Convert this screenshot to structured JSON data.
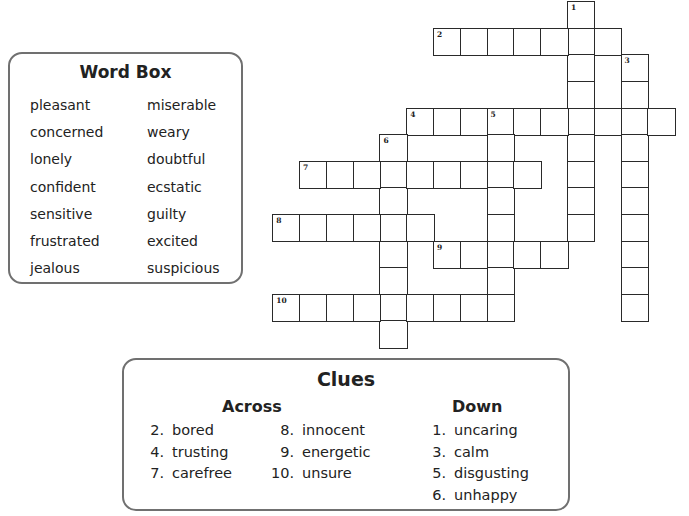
{
  "word_box": {
    "title": "Word Box",
    "left_column": [
      "pleasant",
      "concerned",
      "lonely",
      "confident",
      "sensitive",
      "frustrated",
      "jealous"
    ],
    "right_column": [
      "miserable",
      "weary",
      "doubtful",
      "ecstatic",
      "guilty",
      "excited",
      "suspicious"
    ]
  },
  "clues": {
    "title": "Clues",
    "across_heading": "Across",
    "down_heading": "Down",
    "across": [
      {
        "num": "2.",
        "text": "bored"
      },
      {
        "num": "4.",
        "text": "trusting"
      },
      {
        "num": "7.",
        "text": "carefree"
      },
      {
        "num": "8.",
        "text": "innocent"
      },
      {
        "num": "9.",
        "text": "energetic"
      },
      {
        "num": "10.",
        "text": "unsure"
      }
    ],
    "down": [
      {
        "num": "1.",
        "text": "uncaring"
      },
      {
        "num": "3.",
        "text": "calm"
      },
      {
        "num": "5.",
        "text": "disgusting"
      },
      {
        "num": "6.",
        "text": "unhappy"
      }
    ]
  },
  "grid": {
    "origin_x": 273,
    "origin_y": 2,
    "cell_w": 26.8,
    "cell_h": 26.6,
    "entries": [
      {
        "num": "1",
        "dir": "down",
        "row": 0,
        "col": 11,
        "len": 9
      },
      {
        "num": "2",
        "dir": "across",
        "row": 1,
        "col": 6,
        "len": 7
      },
      {
        "num": "3",
        "dir": "down",
        "row": 2,
        "col": 13,
        "len": 10
      },
      {
        "num": "4",
        "dir": "across",
        "row": 4,
        "col": 5,
        "len": 10
      },
      {
        "num": "5",
        "dir": "down",
        "row": 4,
        "col": 8,
        "len": 8
      },
      {
        "num": "6",
        "dir": "down",
        "row": 5,
        "col": 4,
        "len": 8
      },
      {
        "num": "7",
        "dir": "across",
        "row": 6,
        "col": 1,
        "len": 9
      },
      {
        "num": "8",
        "dir": "across",
        "row": 8,
        "col": 0,
        "len": 6
      },
      {
        "num": "9",
        "dir": "across",
        "row": 9,
        "col": 6,
        "len": 5
      },
      {
        "num": "10",
        "dir": "across",
        "row": 11,
        "col": 0,
        "len": 9
      }
    ]
  }
}
